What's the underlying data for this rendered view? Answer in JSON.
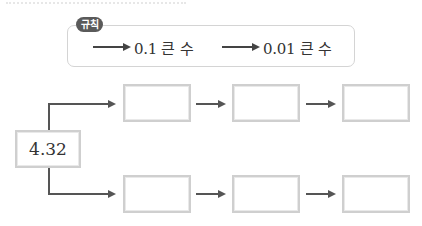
{
  "rule": {
    "badge_label": "규칙",
    "items": [
      {
        "arrow": "right-arrow",
        "label": "0.1 큰 수"
      },
      {
        "arrow": "right-arrow",
        "label": "0.01 큰 수"
      }
    ]
  },
  "diagram": {
    "start_value": "4.32",
    "rows": [
      {
        "name": "top",
        "rule_applied": "0.1 큰 수",
        "boxes": [
          "",
          "",
          ""
        ]
      },
      {
        "name": "bottom",
        "rule_applied": "0.01 큰 수",
        "boxes": [
          "",
          "",
          ""
        ]
      }
    ]
  },
  "colors": {
    "badge_bg": "#5a5a5a",
    "box_border": "#cfcfcf",
    "arrow": "#555555",
    "rule_border": "#d4d4d4"
  }
}
